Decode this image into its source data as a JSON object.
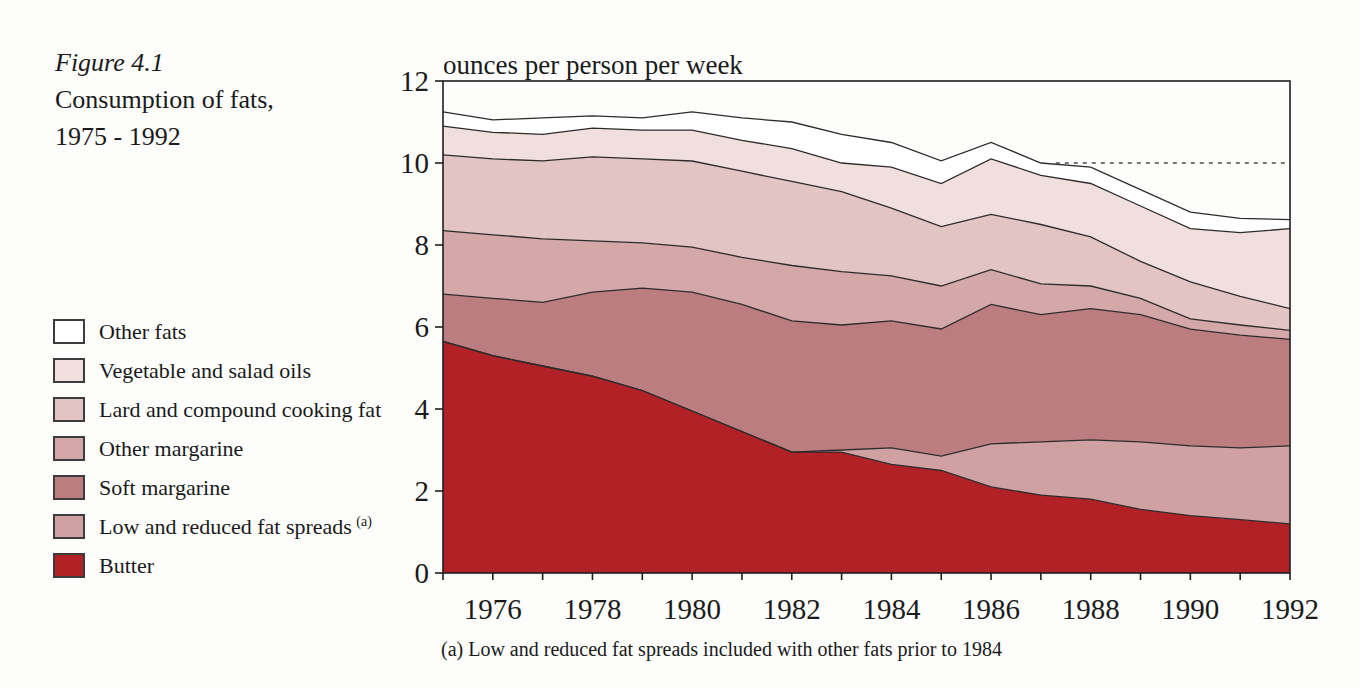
{
  "figure": {
    "label": "Figure 4.1",
    "title_line1": "Consumption of fats,",
    "title_line2": "1975 - 1992"
  },
  "axis_title": "ounces per person per week",
  "footnote": "(a) Low and reduced fat spreads included with other fats prior to 1984",
  "legend": {
    "items": [
      {
        "label": "Other fats",
        "color": "#ffffff"
      },
      {
        "label": "Vegetable and salad oils",
        "color": "#f0dfde"
      },
      {
        "label": "Lard and compound cooking fat",
        "color": "#e1c4c3"
      },
      {
        "label": "Other margarine",
        "color": "#d4a7a8"
      },
      {
        "label": "Soft margarine",
        "color": "#bb7d7f"
      },
      {
        "label": "Low and reduced fat spreads",
        "superscript": "(a)",
        "color": "#cfa1a3"
      },
      {
        "label": "Butter",
        "color": "#b22126"
      }
    ]
  },
  "chart_data": {
    "type": "area",
    "stacked": true,
    "title": "Consumption of fats, 1975 - 1992",
    "ylabel": "ounces per person per week",
    "xlabel": "",
    "ylim": [
      0,
      12
    ],
    "yticks": [
      0,
      2,
      4,
      6,
      8,
      10,
      12
    ],
    "x": [
      1975,
      1976,
      1977,
      1978,
      1979,
      1980,
      1981,
      1982,
      1983,
      1984,
      1985,
      1986,
      1987,
      1988,
      1989,
      1990,
      1991,
      1992
    ],
    "xtick_labels": [
      1976,
      1978,
      1980,
      1982,
      1984,
      1986,
      1988,
      1990,
      1992
    ],
    "grid": false,
    "legend_position": "left",
    "line_color": "#2e2b2b",
    "axis_color": "#1f1f1f",
    "series": [
      {
        "name": "Butter",
        "color": "#b22126",
        "values": [
          5.65,
          5.3,
          5.05,
          4.8,
          4.45,
          3.95,
          3.45,
          2.95,
          2.95,
          2.65,
          2.5,
          2.1,
          1.9,
          1.8,
          1.55,
          1.4,
          1.3,
          1.2
        ]
      },
      {
        "name": "Low and reduced fat spreads",
        "color": "#cfa1a3",
        "values": [
          0,
          0,
          0,
          0,
          0,
          0,
          0,
          0,
          0.05,
          0.4,
          0.35,
          1.05,
          1.3,
          1.45,
          1.65,
          1.7,
          1.75,
          1.9
        ]
      },
      {
        "name": "Soft margarine",
        "color": "#bb7d7f",
        "values": [
          1.15,
          1.4,
          1.55,
          2.05,
          2.5,
          2.9,
          3.1,
          3.2,
          3.05,
          3.1,
          3.1,
          3.4,
          3.1,
          3.2,
          3.1,
          2.85,
          2.75,
          2.6
        ]
      },
      {
        "name": "Other margarine",
        "color": "#d4a7a8",
        "values": [
          1.55,
          1.55,
          1.55,
          1.25,
          1.1,
          1.1,
          1.15,
          1.35,
          1.3,
          1.1,
          1.05,
          0.85,
          0.75,
          0.55,
          0.4,
          0.25,
          0.25,
          0.22
        ]
      },
      {
        "name": "Lard and compound cooking fat",
        "color": "#e1c4c3",
        "values": [
          1.85,
          1.85,
          1.9,
          2.05,
          2.05,
          2.1,
          2.1,
          2.05,
          1.95,
          1.65,
          1.45,
          1.35,
          1.45,
          1.2,
          0.9,
          0.9,
          0.7,
          0.53
        ]
      },
      {
        "name": "Vegetable and salad oils",
        "color": "#f0dfde",
        "values": [
          0.7,
          0.65,
          0.65,
          0.7,
          0.7,
          0.75,
          0.75,
          0.8,
          0.7,
          1.0,
          1.05,
          1.35,
          1.2,
          1.3,
          1.35,
          1.3,
          1.55,
          1.95
        ]
      },
      {
        "name": "Other fats",
        "color": "#ffffff",
        "values": [
          0.35,
          0.3,
          0.4,
          0.3,
          0.3,
          0.45,
          0.55,
          0.65,
          0.7,
          0.6,
          0.55,
          0.4,
          0.3,
          0.4,
          0.4,
          0.4,
          0.35,
          0.22
        ]
      }
    ],
    "dotted_reference_line": {
      "y": 10,
      "x_start": 1987.3,
      "x_end": 1992
    }
  }
}
